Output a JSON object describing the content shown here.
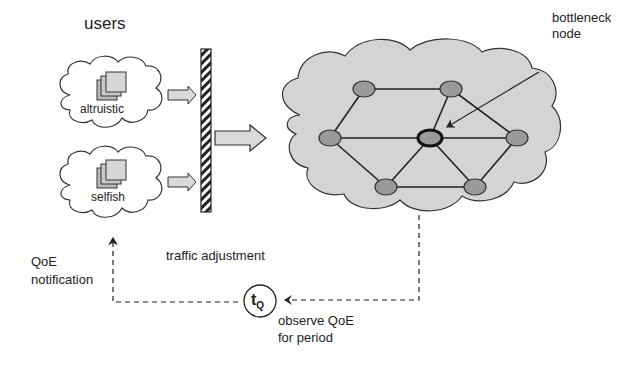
{
  "diagram": {
    "title_users": "users",
    "user_groups": [
      {
        "label": "altruistic"
      },
      {
        "label": "selfish"
      }
    ],
    "traffic_adjustment": "traffic adjustment",
    "bottleneck_label_line1": "bottleneck",
    "bottleneck_label_line2": "node",
    "qoe_notification_line1": "QoE",
    "qoe_notification_line2": "notification",
    "timer_label": "t",
    "timer_subscript": "Q",
    "observe_line1": "observe QoE",
    "observe_line2": "for period",
    "colors": {
      "cloud_fill": "#d4d4d4",
      "node_fill": "#9a9a9a",
      "arrow_fill": "#d9d9d9",
      "stroke": "#222222"
    }
  }
}
